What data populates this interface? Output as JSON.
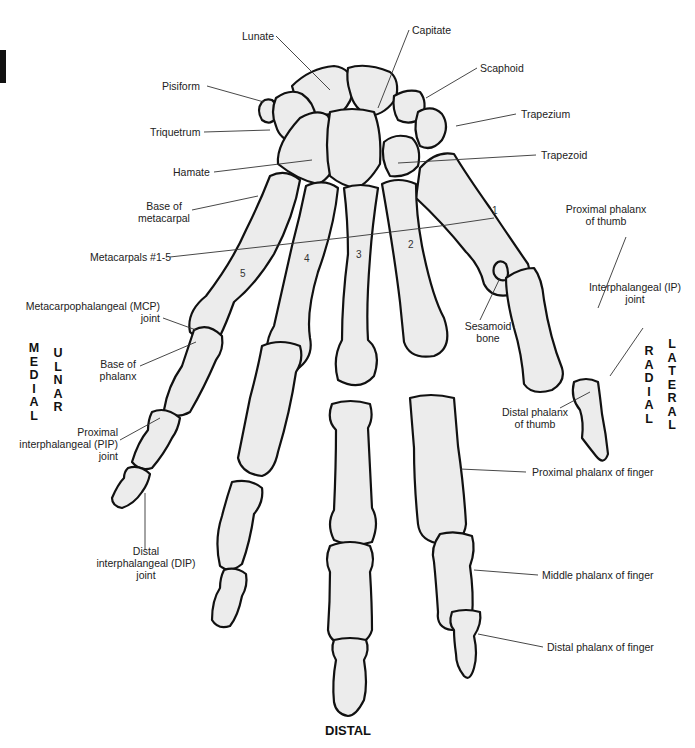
{
  "figure": {
    "orientation": {
      "bottom": "DISTAL",
      "left_outer": "MEDIAL",
      "left_inner": "ULNAR",
      "right_inner": "RADIAL",
      "right_outer": "LATERAL"
    },
    "labels": {
      "lunate": "Lunate",
      "capitate": "Capitate",
      "scaphoid": "Scaphoid",
      "pisiform": "Pisiform",
      "trapezium": "Trapezium",
      "triquetrum": "Triquetrum",
      "trapezoid": "Trapezoid",
      "hamate": "Hamate",
      "base_of_metacarpal_1": "Base of",
      "base_of_metacarpal_2": "metacarpal",
      "proximal_phalanx_thumb_1": "Proximal phalanx",
      "proximal_phalanx_thumb_2": "of thumb",
      "metacarpals": "Metacarpals #1-5",
      "mcp_joint_1": "Metacarpophalangeal (MCP)",
      "mcp_joint_2": "joint",
      "ip_joint_1": "Interphalangeal (IP)",
      "ip_joint_2": "joint",
      "sesamoid_1": "Sesamoid",
      "sesamoid_2": "bone",
      "base_of_phalanx_1": "Base of",
      "base_of_phalanx_2": "phalanx",
      "distal_phalanx_thumb_1": "Distal phalanx",
      "distal_phalanx_thumb_2": "of thumb",
      "pip_joint_1": "Proximal",
      "pip_joint_2": "interphalangeal (PIP)",
      "pip_joint_3": "joint",
      "proximal_phalanx_finger": "Proximal phalanx of finger",
      "dip_joint_1": "Distal",
      "dip_joint_2": "interphalangeal (DIP)",
      "dip_joint_3": "joint",
      "middle_phalanx_finger": "Middle phalanx of finger",
      "distal_phalanx_finger": "Distal phalanx of finger"
    },
    "metacarpal_numbers": [
      "1",
      "2",
      "3",
      "4",
      "5"
    ]
  }
}
